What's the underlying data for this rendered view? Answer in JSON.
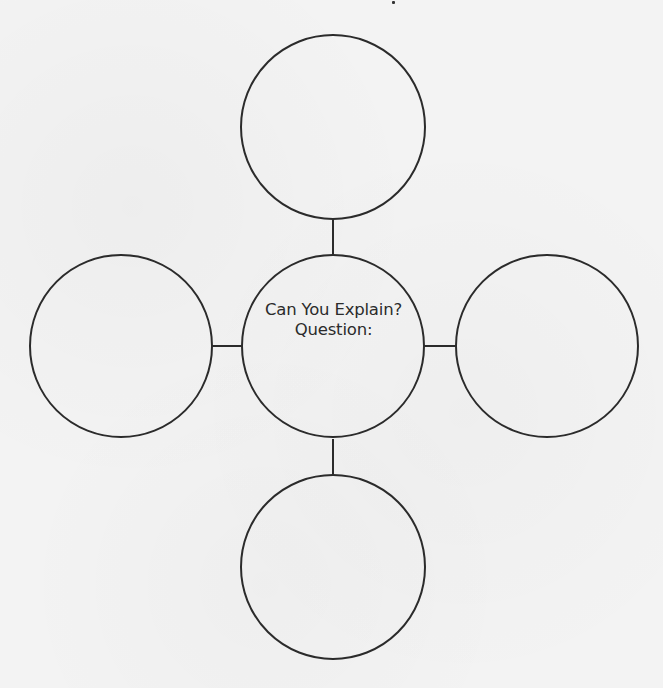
{
  "diagram": {
    "type": "concept-web",
    "center": {
      "title": "Can You Explain?",
      "prompt": "Question:"
    },
    "outer_nodes": [
      {
        "position": "top",
        "text": ""
      },
      {
        "position": "left",
        "text": ""
      },
      {
        "position": "right",
        "text": ""
      },
      {
        "position": "bottom",
        "text": ""
      }
    ],
    "colors": {
      "stroke": "#2b2b2b",
      "text": "#2b2b2b",
      "background": "#f3f3f3"
    }
  }
}
